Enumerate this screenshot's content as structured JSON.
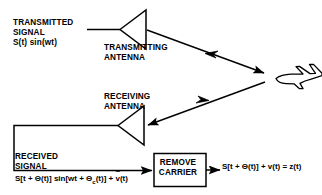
{
  "diagram": {
    "colors": {
      "background": "#ffffff",
      "stroke": "#000000",
      "text": "#000000"
    },
    "labels": {
      "transmitted_line1": "TRANSMITTED",
      "transmitted_line2": "SIGNAL",
      "transmitted_formula": "S(t) sin(wt)",
      "transmitting_antenna_line1": "TRANSMITTING",
      "transmitting_antenna_line2": "ANTENNA",
      "receiving_antenna_line1": "RECEIVING",
      "receiving_antenna_line2": "ANTENNA",
      "received_line1": "RECEIVED",
      "received_line2": "SIGNAL",
      "received_formula_part1": "S[t + Θ(t)]  sin[wt + Θ",
      "received_formula_sub": "c",
      "received_formula_part2": "(t)] + ",
      "received_formula_tilde_var": "v",
      "received_formula_part3": "(t)",
      "remove_carrier_line1": "REMOVE",
      "remove_carrier_line2": "CARRIER",
      "output_formula": "S[t + Θ(t)] + v(t) = z(t)"
    },
    "icons": {
      "aircraft": "airplane-icon",
      "transmitting_antenna": "antenna-triangle-icon",
      "receiving_antenna": "antenna-triangle-icon"
    }
  }
}
